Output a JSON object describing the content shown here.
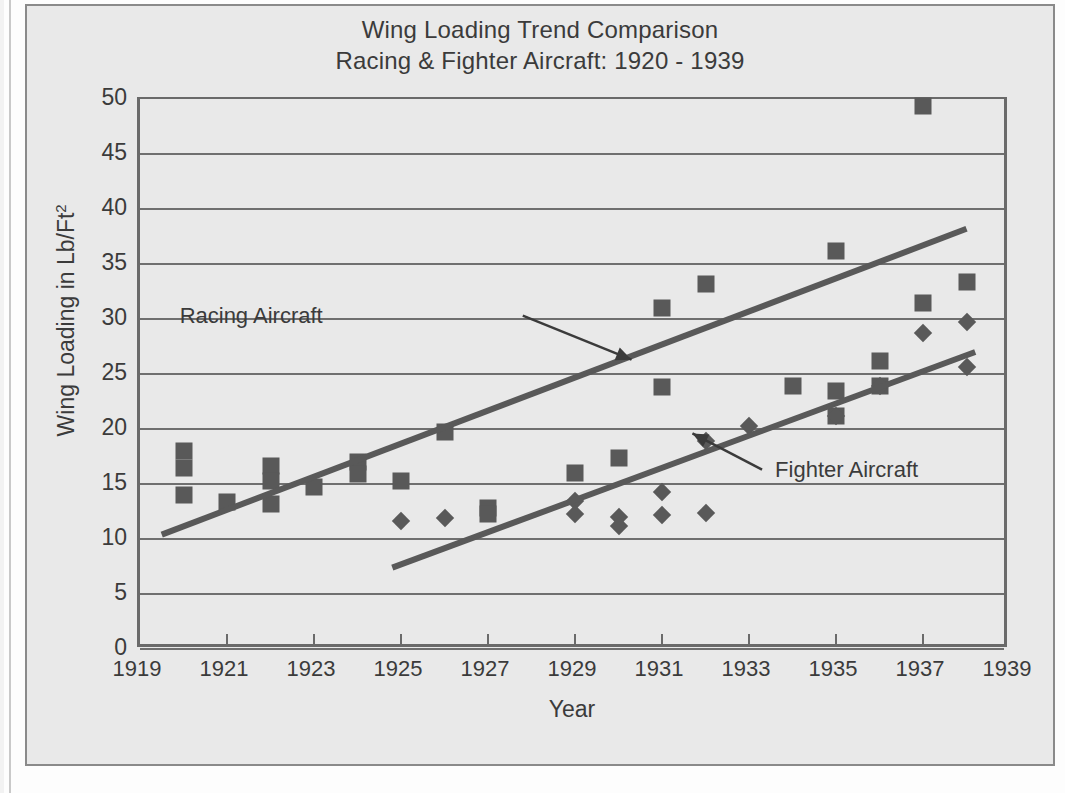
{
  "chart_data": {
    "type": "scatter",
    "title": "Wing Loading Trend Comparison",
    "subtitle": "Racing & Fighter Aircraft: 1920 - 1939",
    "xlabel": "Year",
    "ylabel": "Wing Loading in Lb/Ft",
    "ylabel_sup": "2",
    "xlim": [
      1919,
      1939
    ],
    "ylim": [
      0,
      50
    ],
    "xticks": [
      1919,
      1921,
      1923,
      1925,
      1927,
      1929,
      1931,
      1933,
      1935,
      1937,
      1939
    ],
    "yticks": [
      0,
      5,
      10,
      15,
      20,
      25,
      30,
      35,
      40,
      45,
      50
    ],
    "grid": "horizontal",
    "legend": "none",
    "marker_color": "#595959",
    "line_color": "#595959",
    "plot_bg": "#e9e9e9",
    "series": [
      {
        "name": "Racing Aircraft",
        "marker": "square",
        "points": [
          [
            1920,
            18.0
          ],
          [
            1920,
            16.5
          ],
          [
            1920,
            14.0
          ],
          [
            1921,
            13.4
          ],
          [
            1922,
            16.6
          ],
          [
            1922,
            15.3
          ],
          [
            1922,
            13.2
          ],
          [
            1923,
            14.7
          ],
          [
            1924,
            17.0
          ],
          [
            1924,
            15.9
          ],
          [
            1925,
            15.3
          ],
          [
            1926,
            19.7
          ],
          [
            1927,
            12.8
          ],
          [
            1927,
            12.3
          ],
          [
            1929,
            16.0
          ],
          [
            1930,
            17.4
          ],
          [
            1931,
            31.0
          ],
          [
            1931,
            23.8
          ],
          [
            1932,
            33.2
          ],
          [
            1934,
            23.9
          ],
          [
            1935,
            36.2
          ],
          [
            1935,
            23.5
          ],
          [
            1935,
            21.2
          ],
          [
            1936,
            26.2
          ],
          [
            1936,
            23.9
          ],
          [
            1937,
            49.4
          ],
          [
            1937,
            31.5
          ],
          [
            1938,
            33.4
          ]
        ]
      },
      {
        "name": "Fighter Aircraft",
        "marker": "diamond",
        "points": [
          [
            1925,
            11.6
          ],
          [
            1926,
            11.9
          ],
          [
            1929,
            13.5
          ],
          [
            1929,
            12.3
          ],
          [
            1930,
            12.0
          ],
          [
            1930,
            11.2
          ],
          [
            1931,
            14.3
          ],
          [
            1931,
            12.2
          ],
          [
            1932,
            18.9
          ],
          [
            1932,
            12.4
          ],
          [
            1933,
            20.3
          ],
          [
            1935,
            21.2
          ],
          [
            1936,
            23.9
          ],
          [
            1937,
            28.7
          ],
          [
            1938,
            29.7
          ],
          [
            1938,
            25.6
          ]
        ]
      }
    ],
    "trendlines": [
      {
        "name": "Racing Aircraft trend",
        "x0": 1919.5,
        "y0": 10.4,
        "x1": 1938.0,
        "y1": 38.2
      },
      {
        "name": "Fighter Aircraft trend",
        "x0": 1924.8,
        "y0": 7.4,
        "x1": 1938.2,
        "y1": 27.0
      }
    ],
    "annotations": [
      {
        "label": "Racing Aircraft",
        "text_x": 1923.2,
        "text_y": 30.3,
        "arrow_from_x": 1927.8,
        "arrow_from_y": 30.3,
        "arrow_to_x": 1930.3,
        "arrow_to_y": 26.3
      },
      {
        "label": "Fighter Aircraft",
        "text_x": 1933.6,
        "text_y": 16.3,
        "arrow_from_x": 1933.3,
        "arrow_from_y": 16.3,
        "arrow_to_x": 1931.7,
        "arrow_to_y": 19.6
      }
    ]
  }
}
